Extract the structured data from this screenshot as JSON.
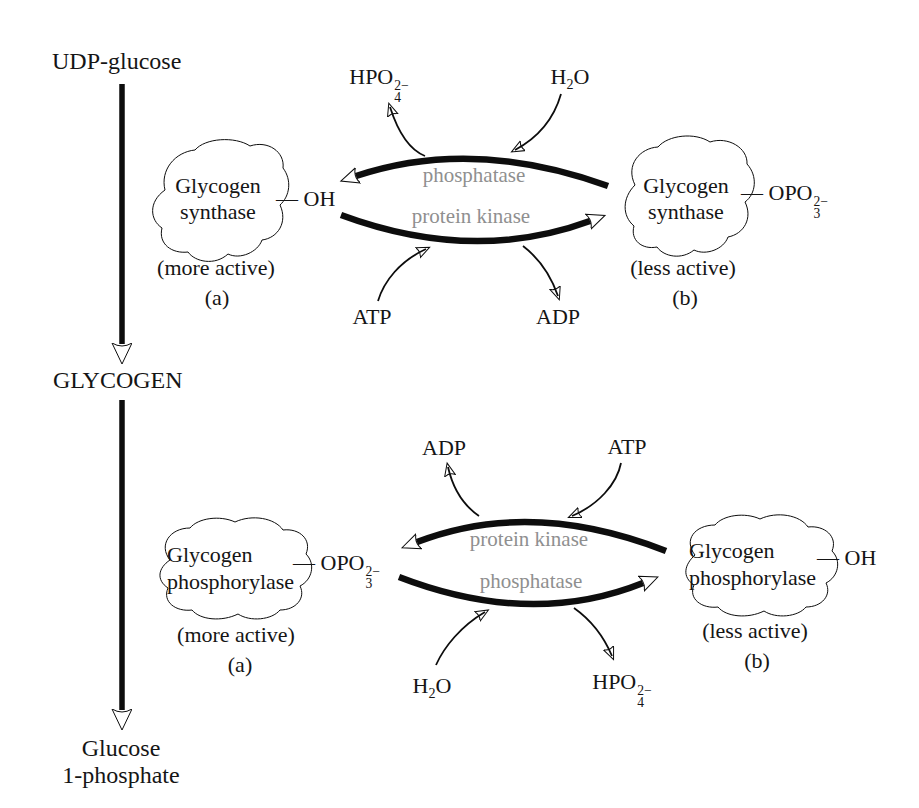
{
  "pathway": {
    "start": "UDP-glucose",
    "middle": "GLYCOGEN",
    "end_line1": "Glucose",
    "end_line2": "1-phosphate"
  },
  "top_cycle": {
    "enzyme_name_line1": "Glycogen",
    "enzyme_name_line2": "synthase",
    "active_form": {
      "state": "(more active)",
      "tag": "(a)"
    },
    "inactive_form": {
      "state": "(less active)",
      "tag": "(b)"
    },
    "active_attachment": [
      {
        "text": "— OH"
      }
    ],
    "inactive_attachment": [
      {
        "text": "— OPO"
      },
      {
        "stack": [
          "2−",
          "3"
        ]
      }
    ],
    "phosphatase_label": "phosphatase",
    "kinase_label": "protein kinase",
    "phosphate": [
      {
        "text": "HPO"
      },
      {
        "stack": [
          "2−",
          "4"
        ]
      }
    ],
    "water": [
      {
        "text": "H"
      },
      {
        "sub": "2"
      },
      {
        "text": "O"
      }
    ],
    "atp": "ATP",
    "adp": "ADP"
  },
  "bottom_cycle": {
    "enzyme_name_line1": "Glycogen",
    "enzyme_name_line2": "phosphorylase",
    "active_form": {
      "state": "(more active)",
      "tag": "(a)"
    },
    "inactive_form": {
      "state": "(less active)",
      "tag": "(b)"
    },
    "active_attachment": [
      {
        "text": "— OPO"
      },
      {
        "stack": [
          "2−",
          "3"
        ]
      }
    ],
    "inactive_attachment": [
      {
        "text": "— OH"
      }
    ],
    "kinase_label": "protein kinase",
    "phosphatase_label": "phosphatase",
    "phosphate": [
      {
        "text": "HPO"
      },
      {
        "stack": [
          "2−",
          "4"
        ]
      }
    ],
    "water": [
      {
        "text": "H"
      },
      {
        "sub": "2"
      },
      {
        "text": "O"
      }
    ],
    "atp": "ATP",
    "adp": "ADP"
  },
  "colors": {
    "background": "#ffffff",
    "active_blob_gray": "#b5b5b5",
    "inactive_blob_light_gray": "#cbcbcb",
    "enzyme_label_gray": "#8f8f8f",
    "line_black": "#0d0d0d"
  }
}
